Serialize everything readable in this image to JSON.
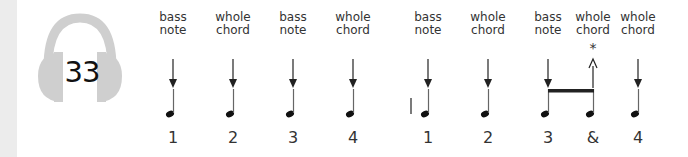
{
  "track": {
    "number": "33",
    "icon": "headphones-icon"
  },
  "beats": [
    {
      "label": [
        "bass",
        "note"
      ],
      "count": "1",
      "stroke": "down"
    },
    {
      "label": [
        "whole",
        "chord"
      ],
      "count": "2",
      "stroke": "down"
    },
    {
      "label": [
        "bass",
        "note"
      ],
      "count": "3",
      "stroke": "down"
    },
    {
      "label": [
        "whole",
        "chord"
      ],
      "count": "4",
      "stroke": "down"
    },
    {
      "label": [
        "bass",
        "note"
      ],
      "count": "1",
      "stroke": "down"
    },
    {
      "label": [
        "whole",
        "chord"
      ],
      "count": "2",
      "stroke": "down"
    },
    {
      "label": [
        "bass",
        "note"
      ],
      "count": "3",
      "stroke": "down"
    },
    {
      "label": [
        "whole",
        "chord"
      ],
      "count": "&",
      "stroke": "up"
    },
    {
      "label": [
        "whole",
        "chord"
      ],
      "count": "4",
      "stroke": "down"
    }
  ],
  "annotation": {
    "symbol": "*"
  }
}
